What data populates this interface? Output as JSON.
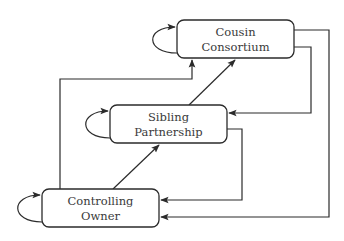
{
  "diagram": {
    "nodes": [
      {
        "id": "cousin",
        "line1": "Cousin",
        "line2": "Consortium"
      },
      {
        "id": "sibling",
        "line1": "Sibling",
        "line2": "Partnership"
      },
      {
        "id": "controlling",
        "line1": "Controlling",
        "line2": "Owner"
      }
    ],
    "edges": [
      {
        "from": "cousin",
        "to": "cousin",
        "kind": "self-loop"
      },
      {
        "from": "sibling",
        "to": "sibling",
        "kind": "self-loop"
      },
      {
        "from": "controlling",
        "to": "controlling",
        "kind": "self-loop"
      },
      {
        "from": "controlling",
        "to": "sibling"
      },
      {
        "from": "sibling",
        "to": "cousin"
      },
      {
        "from": "controlling",
        "to": "cousin"
      },
      {
        "from": "cousin",
        "to": "sibling"
      },
      {
        "from": "sibling",
        "to": "controlling"
      },
      {
        "from": "cousin",
        "to": "controlling"
      }
    ]
  }
}
